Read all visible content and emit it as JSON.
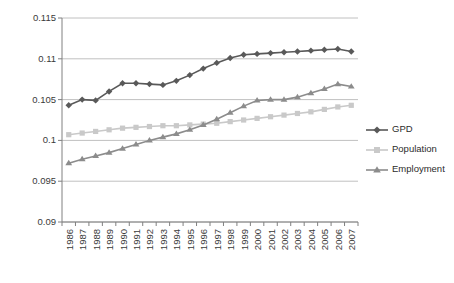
{
  "chart_data": {
    "type": "line",
    "title": "",
    "xlabel": "",
    "ylabel": "",
    "ylim": [
      0.09,
      0.115
    ],
    "yticks": [
      "0.115",
      "0.11",
      "0.105",
      "0.1",
      "0.095",
      "0.09"
    ],
    "ytick_values": [
      0.115,
      0.11,
      0.105,
      0.1,
      0.095,
      0.09
    ],
    "grid": true,
    "legend_position": "right",
    "categories": [
      "1986",
      "1987",
      "1988",
      "1989",
      "1990",
      "1991",
      "1992",
      "1993",
      "1994",
      "1995",
      "1996",
      "1997",
      "1998",
      "1999",
      "2000",
      "2001",
      "2002",
      "2003",
      "2004",
      "2005",
      "2006",
      "2007"
    ],
    "series": [
      {
        "name": "GPD",
        "color": "#595959",
        "marker": "diamond",
        "values": [
          0.1043,
          0.105,
          0.1049,
          0.106,
          0.107,
          0.107,
          0.1069,
          0.1068,
          0.1073,
          0.108,
          0.1088,
          0.1095,
          0.1101,
          0.1105,
          0.1106,
          0.1107,
          0.1108,
          0.1109,
          0.111,
          0.1111,
          0.1112,
          0.1109
        ]
      },
      {
        "name": "Population",
        "color": "#c9c9c9",
        "marker": "square",
        "values": [
          0.1007,
          0.1009,
          0.1011,
          0.1013,
          0.1015,
          0.1016,
          0.1017,
          0.1018,
          0.1018,
          0.1019,
          0.102,
          0.1021,
          0.1023,
          0.1025,
          0.1027,
          0.1029,
          0.1031,
          0.1033,
          0.1035,
          0.1038,
          0.1041,
          0.1043
        ]
      },
      {
        "name": "Employment",
        "color": "#8c8c8c",
        "marker": "triangle",
        "values": [
          0.0972,
          0.0977,
          0.0981,
          0.0985,
          0.099,
          0.0995,
          0.1,
          0.1004,
          0.1008,
          0.1013,
          0.1019,
          0.1026,
          0.1034,
          0.1042,
          0.1049,
          0.105,
          0.105,
          0.1053,
          0.1058,
          0.1063,
          0.1069,
          0.1066
        ]
      }
    ]
  },
  "legend": {
    "items": [
      {
        "label": "GPD"
      },
      {
        "label": "Population"
      },
      {
        "label": "Employment"
      }
    ]
  },
  "colors": {
    "gpd": "#595959",
    "population": "#c9c9c9",
    "employment": "#8c8c8c",
    "gridline": "#c0c0c0",
    "axis": "#808080"
  }
}
